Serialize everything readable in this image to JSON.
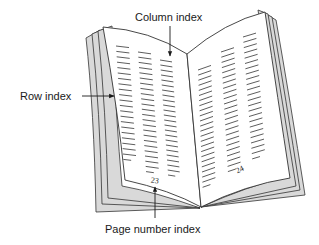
{
  "figure": {
    "type": "diagram",
    "labels": {
      "column_index": "Column index",
      "row_index": "Row index",
      "page_number_index": "Page number index"
    },
    "pages": {
      "left_number": "23",
      "right_number": "24"
    },
    "colors": {
      "line": "#333333",
      "page_fill": "#ffffff",
      "edge_fill": "#d9d9d9",
      "text": "#1a1a1a"
    }
  }
}
